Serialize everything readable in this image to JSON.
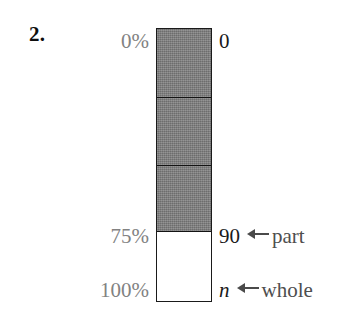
{
  "figure": {
    "problem_number": "2.",
    "type": "percent-bar-diagram"
  },
  "left_labels": {
    "top": "0%",
    "part": "75%",
    "whole": "100%"
  },
  "right_labels": {
    "top": "0",
    "part_value": "90",
    "whole_value": "n",
    "part_tag": "part",
    "whole_tag": "whole"
  },
  "bar": {
    "shaded_percent": "75%",
    "unshaded_percent": "25%",
    "segment_count": "3",
    "shaded_color": "#7c7c7c",
    "unshaded_color": "#ffffff",
    "outline_color": "#1a1a1a"
  },
  "colors": {
    "percent_text": "#828282",
    "value_text": "#1a1a1a",
    "tag_text": "#4e4e4e",
    "number_text": "#0d0d0d"
  }
}
